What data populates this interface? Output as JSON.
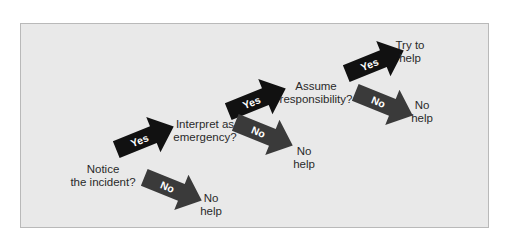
{
  "diagram": {
    "type": "decision-flow",
    "colors": {
      "panel_background": "#e9e9e9",
      "panel_border": "#b9b9b9",
      "yes_arrow": "#111111",
      "no_arrow": "#3a3a3a",
      "arrow_text": "#ffffff",
      "label_text": "#2a2a2a"
    },
    "steps": [
      {
        "question_line1": "Notice",
        "question_line2": "the incident?",
        "yes_label": "Yes",
        "no_label": "No",
        "no_outcome_line1": "No",
        "no_outcome_line2": "help"
      },
      {
        "question_line1": "Interpret as",
        "question_line2": "emergency?",
        "yes_label": "Yes",
        "no_label": "No",
        "no_outcome_line1": "No",
        "no_outcome_line2": "help"
      },
      {
        "question_line1": "Assume",
        "question_line2": "responsibility?",
        "yes_label": "Yes",
        "no_label": "No",
        "no_outcome_line1": "No",
        "no_outcome_line2": "help"
      }
    ],
    "final_outcome": {
      "line1": "Try to",
      "line2": "help"
    }
  }
}
